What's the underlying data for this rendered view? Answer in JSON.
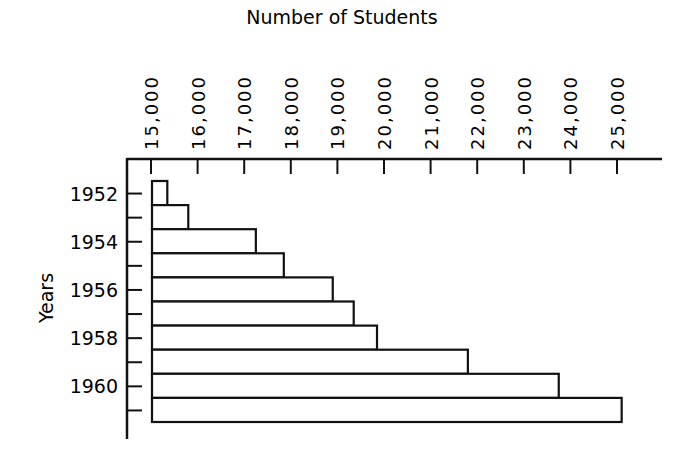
{
  "chart_data": {
    "type": "bar",
    "orientation": "horizontal",
    "title": "Number of Students",
    "xlabel": "Number of Students",
    "ylabel": "Years",
    "xlim": [
      15000,
      25000
    ],
    "x_ticks": [
      15000,
      16000,
      17000,
      18000,
      19000,
      20000,
      21000,
      22000,
      23000,
      24000,
      25000
    ],
    "x_tick_labels": [
      "15,000",
      "16,000",
      "17,000",
      "18,000",
      "19,000",
      "20,000",
      "21,000",
      "22,000",
      "23,000",
      "24,000",
      "25,000"
    ],
    "x_axis_position": "top",
    "y_tick_labels": [
      "1952",
      "",
      "1954",
      "",
      "1956",
      "",
      "1958",
      "",
      "1960",
      ""
    ],
    "categories": [
      "1952",
      "1953",
      "1954",
      "1955",
      "1956",
      "1957",
      "1958",
      "1959",
      "1960",
      "1961"
    ],
    "values": [
      15350,
      15800,
      17250,
      17850,
      18900,
      19350,
      19850,
      21800,
      23750,
      25100
    ],
    "grid": false,
    "legend": null
  },
  "colors": {
    "ink": "#111111",
    "background": "#ffffff",
    "bar_fill": "#ffffff"
  }
}
